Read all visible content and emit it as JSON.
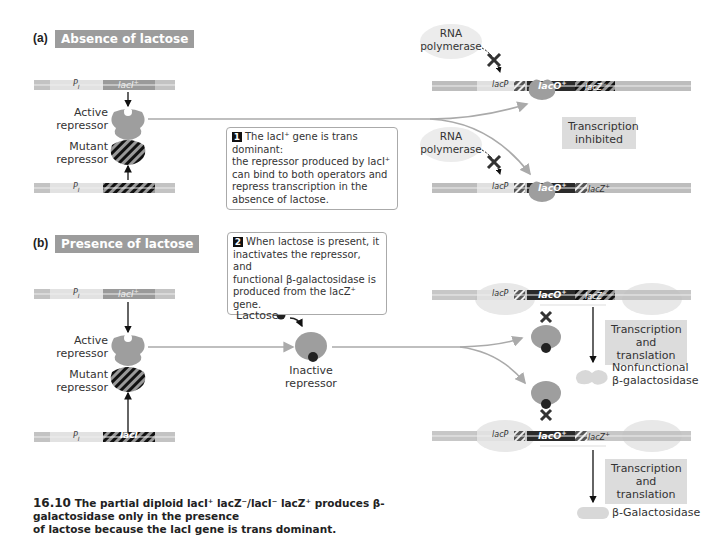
{
  "panel_a": {
    "letter": "(a)",
    "title": "Absence of lactose",
    "top_gene": {
      "promoter": "P",
      "promoter_sub": "I",
      "gene": "lacI",
      "gene_sup": "+"
    },
    "bottom_gene": {
      "promoter": "P",
      "promoter_sub": "I"
    },
    "active_repressor": [
      "Active",
      "repressor"
    ],
    "mutant_repressor": [
      "Mutant",
      "repressor"
    ],
    "rna_polymerase_1": [
      "RNA",
      "polymerase"
    ],
    "rna_polymerase_2": [
      "RNA",
      "polymerase"
    ],
    "operon_1": {
      "promoter": "lacP",
      "operator": "lacO",
      "operator_sup": "+",
      "gene": "lacZ",
      "gene_sup": "−"
    },
    "operon_2": {
      "promoter": "lacP",
      "operator": "lacO",
      "operator_sup": "+",
      "gene": "lacZ",
      "gene_sup": "+"
    },
    "result": [
      "Transcription",
      "inhibited"
    ],
    "callout": {
      "number": "1",
      "lines": [
        "The lacI⁺ gene is trans dominant:",
        "the repressor produced by lacI⁺",
        "can bind to both operators and",
        "repress transcription in the",
        "absence of lactose."
      ]
    }
  },
  "panel_b": {
    "letter": "(b)",
    "title": "Presence of lactose",
    "top_gene": {
      "promoter": "P",
      "promoter_sub": "I",
      "gene": "lacI",
      "gene_sup": "+"
    },
    "bottom_gene": {
      "promoter": "P",
      "promoter_sub": "I",
      "gene": "lacI",
      "gene_sup": "−"
    },
    "active_repressor": [
      "Active",
      "repressor"
    ],
    "mutant_repressor": [
      "Mutant",
      "repressor"
    ],
    "lactose_label": "Lactose",
    "inactive_repressor": [
      "Inactive",
      "repressor"
    ],
    "operon_1": {
      "promoter": "lacP",
      "operator": "lacO",
      "operator_sup": "+",
      "gene": "lacZ",
      "gene_sup": "−"
    },
    "operon_2": {
      "promoter": "lacP",
      "operator": "lacO",
      "operator_sup": "+",
      "gene": "lacZ",
      "gene_sup": "+"
    },
    "result_1": [
      "Transcription",
      "and translation"
    ],
    "result_2": [
      "Transcription",
      "and translation"
    ],
    "product_1": [
      "Nonfunctional",
      "β-galactosidase"
    ],
    "product_2": "β-Galactosidase",
    "callout": {
      "number": "2",
      "lines": [
        "When lactose is present, it",
        "inactivates the repressor, and",
        "functional β-galactosidase is",
        "produced from the lacZ⁺ gene."
      ]
    }
  },
  "caption": {
    "figure_number": "16.10",
    "line1": "The partial diploid lacI⁺ lacZ⁻/lacI⁻ lacZ⁺ produces β-galactosidase only in the presence",
    "line2": "of lactose because the lacI gene is trans dominant."
  },
  "colors": {
    "dna": "#b9b9b9",
    "dna_light": "#dcdcdc",
    "repressor": "#9e9e9e",
    "title_bg": "#9c9c9c",
    "callout_border": "#aaaaaa",
    "lactose": "#222222"
  }
}
